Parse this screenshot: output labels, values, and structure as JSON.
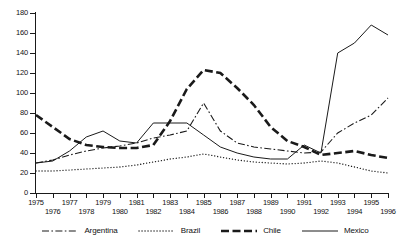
{
  "chart_data": {
    "type": "line",
    "title": "",
    "xlabel": "",
    "ylabel": "",
    "xlim": [
      1975,
      1996
    ],
    "ylim": [
      0,
      180
    ],
    "grid": false,
    "legend_position": "bottom",
    "x": [
      1975,
      1976,
      1977,
      1978,
      1979,
      1980,
      1981,
      1982,
      1983,
      1984,
      1985,
      1986,
      1987,
      1988,
      1989,
      1990,
      1991,
      1992,
      1993,
      1994,
      1995,
      1996
    ],
    "y_ticks": [
      0,
      20,
      40,
      60,
      80,
      100,
      120,
      140,
      160,
      180
    ],
    "x_tick_labels_top": [
      "1975",
      "1977",
      "1979",
      "1981",
      "1983",
      "1985",
      "1987",
      "1989",
      "1991",
      "1993",
      "1995"
    ],
    "x_tick_labels_bottom": [
      "1976",
      "1978",
      "1980",
      "1982",
      "1984",
      "1986",
      "1988",
      "1990",
      "1992",
      "1994",
      "1996"
    ],
    "series": [
      {
        "name": "Argentina",
        "style": "dash-dot",
        "color": "#1a1a1a",
        "values": [
          30,
          33,
          38,
          42,
          45,
          47,
          50,
          55,
          58,
          62,
          90,
          62,
          50,
          46,
          44,
          42,
          40,
          41,
          60,
          70,
          78,
          95
        ]
      },
      {
        "name": "Brazil",
        "style": "dotted",
        "color": "#1a1a1a",
        "values": [
          22,
          22,
          23,
          24,
          25,
          26,
          28,
          31,
          34,
          36,
          39,
          36,
          33,
          31,
          30,
          29,
          30,
          32,
          30,
          26,
          22,
          20
        ]
      },
      {
        "name": "Chile",
        "style": "thick-dashed",
        "color": "#1a1a1a",
        "values": [
          78,
          66,
          54,
          48,
          46,
          45,
          45,
          48,
          72,
          104,
          123,
          120,
          105,
          88,
          66,
          52,
          46,
          38,
          40,
          42,
          38,
          35
        ]
      },
      {
        "name": "Mexico",
        "style": "solid",
        "color": "#1a1a1a",
        "values": [
          30,
          32,
          42,
          56,
          62,
          52,
          50,
          70,
          70,
          70,
          58,
          46,
          40,
          36,
          34,
          34,
          48,
          40,
          140,
          150,
          168,
          158
        ]
      }
    ]
  },
  "legend": {
    "items": [
      {
        "label": "Argentina",
        "marker": "dash-dot-line-marker"
      },
      {
        "label": "Brazil",
        "marker": "dotted-line-marker"
      },
      {
        "label": "Chile",
        "marker": "thick-dashed-line-marker"
      },
      {
        "label": "Mexico",
        "marker": "solid-line-marker"
      }
    ]
  }
}
